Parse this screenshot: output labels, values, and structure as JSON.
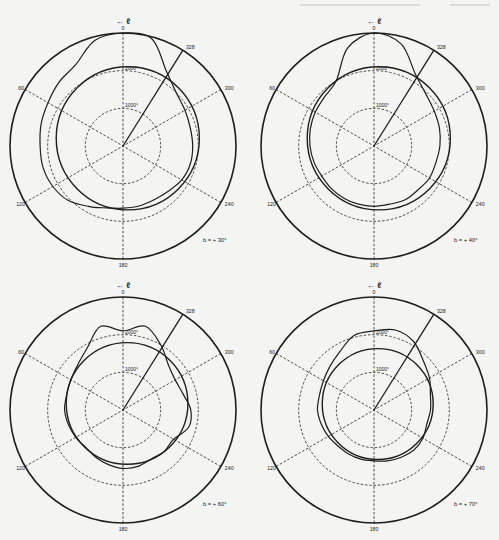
{
  "figure": {
    "stroke_color": "#1e1e1e",
    "background": "#f4f4f2"
  },
  "chart_data": [
    {
      "type": "polar",
      "panel": "top-left",
      "label": "b = + 30°",
      "axis_label": "← ℓ",
      "angle_ticks": [
        "0",
        "60",
        "120",
        "180",
        "240",
        "300",
        "328"
      ],
      "radial_rings": [
        "1000°",
        "2000°"
      ],
      "radial_range": [
        0,
        3000
      ],
      "highlight_direction_deg": 328,
      "series": [
        {
          "name": "reference circle",
          "style": "solid",
          "r_by_angle": {
            "0": 2000,
            "60": 2000,
            "120": 2000,
            "180": 2000,
            "240": 2000,
            "300": 2000
          }
        },
        {
          "name": "observed contour",
          "style": "solid",
          "r_by_angle": {
            "0": 3000,
            "15": 2900,
            "30": 2500,
            "45": 2400,
            "60": 2300,
            "75": 2250,
            "90": 2200,
            "105": 2200,
            "120": 2150,
            "135": 2050,
            "150": 1850,
            "165": 1700,
            "180": 1650,
            "195": 1650,
            "210": 1650,
            "225": 1700,
            "240": 1800,
            "255": 1850,
            "270": 1850,
            "285": 1850,
            "300": 1900,
            "315": 2000,
            "330": 2300,
            "345": 2950
          }
        }
      ]
    },
    {
      "type": "polar",
      "panel": "top-right",
      "label": "b = + 40°",
      "axis_label": "← ℓ",
      "angle_ticks": [
        "0",
        "60",
        "120",
        "180",
        "240",
        "300",
        "328"
      ],
      "radial_rings": [
        "1000°",
        "2000°"
      ],
      "radial_range": [
        0,
        3000
      ],
      "highlight_direction_deg": 328,
      "series": [
        {
          "name": "reference circle",
          "style": "solid",
          "r_by_angle": {
            "0": 2000,
            "60": 2000,
            "120": 2000,
            "180": 2000,
            "240": 2000,
            "300": 2000
          }
        },
        {
          "name": "observed contour",
          "style": "solid",
          "r_by_angle": {
            "0": 3000,
            "15": 2700,
            "30": 2000,
            "45": 1850,
            "60": 1800,
            "75": 1750,
            "90": 1700,
            "105": 1650,
            "120": 1600,
            "135": 1600,
            "150": 1600,
            "165": 1600,
            "180": 1600,
            "195": 1600,
            "210": 1650,
            "225": 1650,
            "240": 1700,
            "255": 1700,
            "270": 1750,
            "285": 1800,
            "300": 1850,
            "315": 1950,
            "330": 2200,
            "345": 2800
          }
        }
      ]
    },
    {
      "type": "polar",
      "panel": "bottom-left",
      "label": "b = + 60°",
      "axis_label": "← ℓ",
      "angle_ticks": [
        "0",
        "60",
        "120",
        "180",
        "240",
        "300",
        "328"
      ],
      "radial_rings": [
        "1000°",
        "2000°"
      ],
      "radial_range": [
        0,
        3000
      ],
      "highlight_direction_deg": 328,
      "series": [
        {
          "name": "reference circle",
          "style": "solid",
          "r_by_angle": {
            "0": 1700,
            "60": 1700,
            "120": 1700,
            "180": 1700,
            "240": 1700,
            "300": 1700
          }
        },
        {
          "name": "observed contour",
          "style": "solid",
          "r_by_angle": {
            "0": 2100,
            "15": 2300,
            "30": 1900,
            "45": 1700,
            "60": 1600,
            "75": 1550,
            "90": 1550,
            "105": 1500,
            "120": 1450,
            "135": 1400,
            "150": 1450,
            "165": 1500,
            "180": 1550,
            "195": 1550,
            "210": 1500,
            "225": 1550,
            "240": 1550,
            "255": 1800,
            "270": 1800,
            "285": 1650,
            "300": 1600,
            "315": 1700,
            "330": 2000,
            "345": 2300
          }
        }
      ]
    },
    {
      "type": "polar",
      "panel": "bottom-right",
      "label": "b = + 70°",
      "axis_label": "← ℓ",
      "angle_ticks": [
        "0",
        "60",
        "120",
        "180",
        "240",
        "300",
        "328"
      ],
      "radial_rings": [
        "1000°",
        "2000°"
      ],
      "radial_range": [
        0,
        3000
      ],
      "highlight_direction_deg": 328,
      "series": [
        {
          "name": "reference circle",
          "style": "solid",
          "r_by_angle": {
            "0": 1550,
            "60": 1550,
            "120": 1550,
            "180": 1550,
            "240": 1550,
            "300": 1550
          }
        },
        {
          "name": "observed contour",
          "style": "solid",
          "r_by_angle": {
            "0": 2100,
            "15": 2050,
            "30": 1800,
            "45": 1650,
            "60": 1550,
            "75": 1500,
            "90": 1500,
            "105": 1450,
            "120": 1400,
            "135": 1350,
            "150": 1350,
            "165": 1350,
            "180": 1350,
            "195": 1400,
            "210": 1450,
            "225": 1500,
            "240": 1500,
            "255": 1450,
            "270": 1500,
            "285": 1550,
            "300": 1700,
            "315": 1850,
            "330": 2100,
            "345": 2200
          }
        }
      ]
    }
  ]
}
